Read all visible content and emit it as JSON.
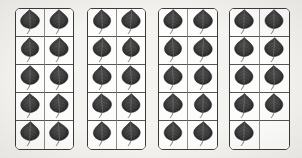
{
  "figure": {
    "type": "specimen-grid",
    "background_color": "#f4f3f0",
    "panel_border_color": "#3b3b3b",
    "panel_fill_color": "#fdfdfc",
    "grid_line_color": "#8d8d8d",
    "leaf_color": "#3a3a3a",
    "panel_count": 4,
    "rows_per_panel": 5,
    "columns_per_panel": 2,
    "total_cells": 40,
    "total_leaves": 39,
    "specimen_label": "leaf",
    "panels": [
      {
        "id": "panel-1",
        "name": "Tray 1",
        "leaf_count": 10,
        "cells": [
          {
            "index": 1,
            "occupied": true
          },
          {
            "index": 2,
            "occupied": true
          },
          {
            "index": 3,
            "occupied": true
          },
          {
            "index": 4,
            "occupied": true
          },
          {
            "index": 5,
            "occupied": true
          },
          {
            "index": 6,
            "occupied": true
          },
          {
            "index": 7,
            "occupied": true
          },
          {
            "index": 8,
            "occupied": true
          },
          {
            "index": 9,
            "occupied": true
          },
          {
            "index": 10,
            "occupied": true
          }
        ]
      },
      {
        "id": "panel-2",
        "name": "Tray 2",
        "leaf_count": 10,
        "cells": [
          {
            "index": 1,
            "occupied": true
          },
          {
            "index": 2,
            "occupied": true
          },
          {
            "index": 3,
            "occupied": true
          },
          {
            "index": 4,
            "occupied": true
          },
          {
            "index": 5,
            "occupied": true
          },
          {
            "index": 6,
            "occupied": true
          },
          {
            "index": 7,
            "occupied": true
          },
          {
            "index": 8,
            "occupied": true
          },
          {
            "index": 9,
            "occupied": true
          },
          {
            "index": 10,
            "occupied": true
          }
        ]
      },
      {
        "id": "panel-3",
        "name": "Tray 3",
        "leaf_count": 10,
        "cells": [
          {
            "index": 1,
            "occupied": true
          },
          {
            "index": 2,
            "occupied": true
          },
          {
            "index": 3,
            "occupied": true
          },
          {
            "index": 4,
            "occupied": true
          },
          {
            "index": 5,
            "occupied": true
          },
          {
            "index": 6,
            "occupied": true
          },
          {
            "index": 7,
            "occupied": true
          },
          {
            "index": 8,
            "occupied": true
          },
          {
            "index": 9,
            "occupied": true
          },
          {
            "index": 10,
            "occupied": true
          }
        ]
      },
      {
        "id": "panel-4",
        "name": "Tray 4",
        "leaf_count": 9,
        "cells": [
          {
            "index": 1,
            "occupied": true
          },
          {
            "index": 2,
            "occupied": true
          },
          {
            "index": 3,
            "occupied": true
          },
          {
            "index": 4,
            "occupied": true
          },
          {
            "index": 5,
            "occupied": true
          },
          {
            "index": 6,
            "occupied": true
          },
          {
            "index": 7,
            "occupied": true
          },
          {
            "index": 8,
            "occupied": true
          },
          {
            "index": 9,
            "occupied": true
          },
          {
            "index": 10,
            "occupied": false
          }
        ]
      }
    ]
  }
}
